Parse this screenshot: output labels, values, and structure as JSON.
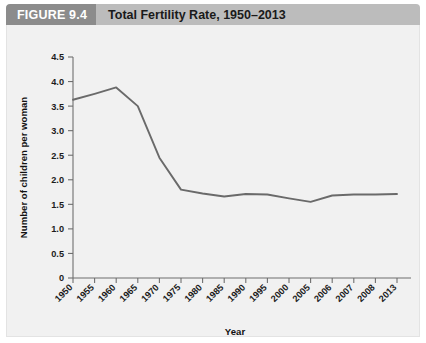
{
  "header": {
    "figure_number": "FIGURE 9.4",
    "figure_title": "Total Fertility Rate, 1950–2013",
    "number_block_color": "#8c8c8c",
    "bar_color": "#bcbcbc",
    "title_text_color": "#1a1a1a"
  },
  "figure": {
    "background_color": "#f1f1f1",
    "border_color": "#e3e3e3",
    "line_color": "#6a6a6a",
    "axis_color": "#6f6f6f"
  },
  "chart_data": {
    "type": "line",
    "title": "Total Fertility Rate, 1950–2013",
    "xlabel": "Year",
    "ylabel": "Number of children per woman",
    "categories": [
      "1950",
      "1955",
      "1960",
      "1965",
      "1970",
      "1975",
      "1980",
      "1985",
      "1990",
      "1995",
      "2000",
      "2005",
      "2006",
      "2007",
      "2008",
      "2013"
    ],
    "values": [
      3.63,
      3.75,
      3.88,
      3.5,
      2.45,
      1.8,
      1.72,
      1.66,
      1.71,
      1.7,
      1.62,
      1.55,
      1.68,
      1.7,
      1.7,
      1.71
    ],
    "ylim": [
      0,
      4.5
    ],
    "yticks": [
      0,
      0.5,
      1.0,
      1.5,
      2.0,
      2.5,
      3.0,
      3.5,
      4.0,
      4.5
    ],
    "ytick_labels": [
      "0",
      "0.5",
      "1.0",
      "1.5",
      "2.0",
      "2.5",
      "3.0",
      "3.5",
      "4.0",
      "4.5"
    ],
    "grid": false,
    "legend": null,
    "legend_position": "none",
    "xtick_rotation_degrees": 45,
    "series": [
      {
        "name": "Total fertility rate",
        "values": [
          3.63,
          3.75,
          3.88,
          3.5,
          2.45,
          1.8,
          1.72,
          1.66,
          1.71,
          1.7,
          1.62,
          1.55,
          1.68,
          1.7,
          1.7,
          1.71
        ]
      }
    ]
  }
}
